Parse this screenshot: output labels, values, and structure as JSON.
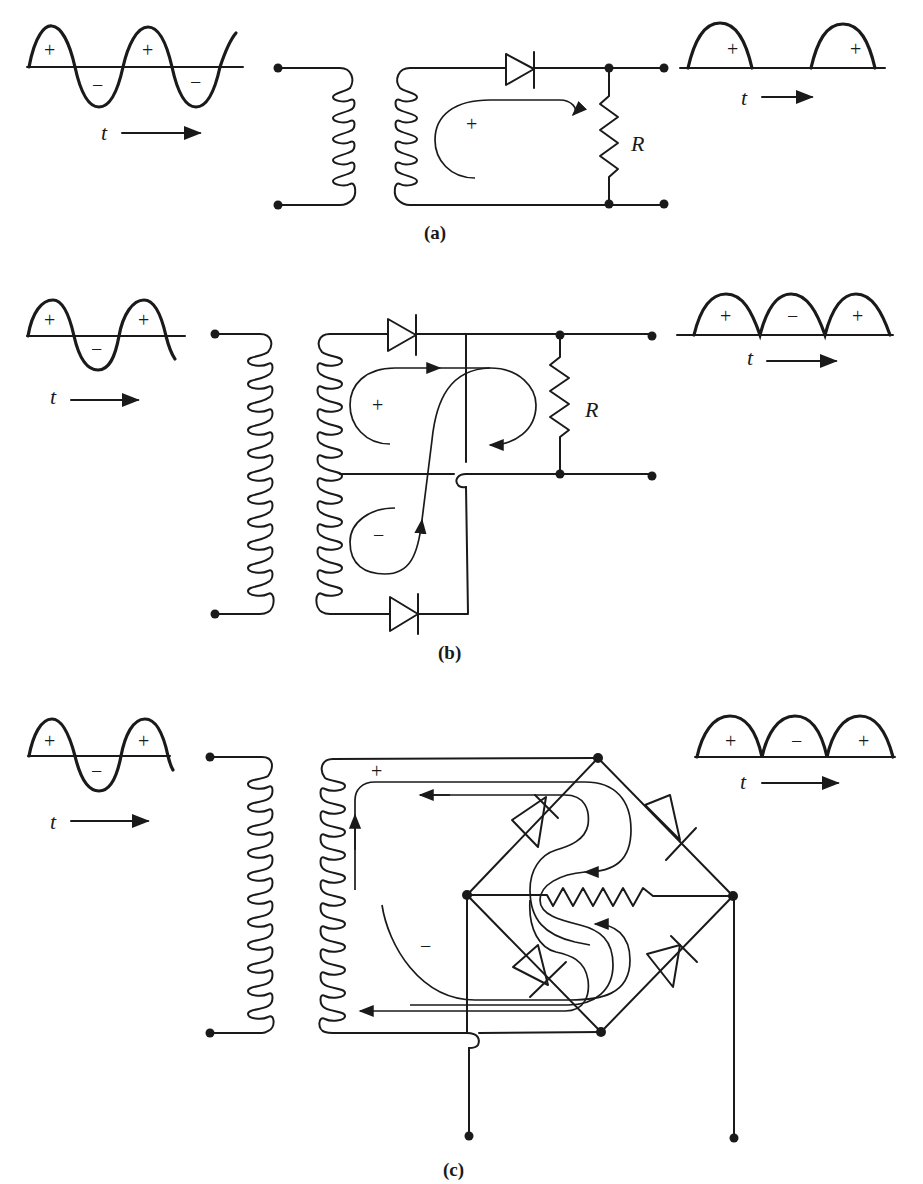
{
  "figure": {
    "panels": [
      {
        "id": "a",
        "caption": "(a)",
        "title": "Half-wave rectifier",
        "input_wave": {
          "labels": [
            "+",
            "−",
            "+",
            "−"
          ],
          "time_label": "t"
        },
        "loop_label": "+",
        "resistor_label": "R",
        "output_wave": {
          "labels": [
            "+",
            "+"
          ],
          "time_label": "t"
        }
      },
      {
        "id": "b",
        "caption": "(b)",
        "title": "Center-tapped full-wave rectifier",
        "input_wave": {
          "labels": [
            "+",
            "−",
            "+"
          ],
          "time_label": "t"
        },
        "loop_labels": [
          "+",
          "−"
        ],
        "resistor_label": "R",
        "output_wave": {
          "labels": [
            "+",
            "−",
            "+"
          ],
          "time_label": "t"
        }
      },
      {
        "id": "c",
        "caption": "(c)",
        "title": "Bridge full-wave rectifier",
        "input_wave": {
          "labels": [
            "+",
            "−",
            "+"
          ],
          "time_label": "t"
        },
        "loop_labels": [
          "+",
          "−"
        ],
        "output_wave": {
          "labels": [
            "+",
            "−",
            "+"
          ],
          "time_label": "t"
        }
      }
    ]
  }
}
